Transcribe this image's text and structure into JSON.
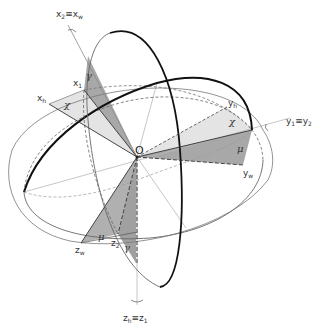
{
  "diagram": {
    "type": "3d-coordinate-frame-rotation",
    "origin_label": "O",
    "axes": {
      "x_top": "x₂≡xᵥ",
      "x_top_main": "x",
      "x_top_sub": "2",
      "x_top_equiv": "≡",
      "x_top_main2": "x",
      "x_top_sub2": "w",
      "y_right_main": "y",
      "y_right_sub": "1",
      "y_right_equiv": "≡",
      "y_right_main2": "y",
      "y_right_sub2": "2",
      "z_bottom_main": "z",
      "z_bottom_sub": "h",
      "z_bottom_equiv": "≡",
      "z_bottom_main2": "z",
      "z_bottom_sub2": "1"
    },
    "points": {
      "x1": {
        "main": "x",
        "sub": "1"
      },
      "xh": {
        "main": "x",
        "sub": "h"
      },
      "yh": {
        "main": "y",
        "sub": "h"
      },
      "yw": {
        "main": "y",
        "sub": "w"
      },
      "zw": {
        "main": "z",
        "sub": "w"
      },
      "z2": {
        "main": "z",
        "sub": "2"
      }
    },
    "angles": {
      "gamma_top": "γ",
      "chi_left": "χ",
      "chi_right": "χ",
      "mu_right": "μ",
      "mu_bottom": "μ",
      "gamma_bottom": "γ"
    },
    "colors": {
      "line": "#2a2a2a",
      "thin_line": "#6a6a6a",
      "light_axis": "#b5b5b5",
      "dark_fill": "#a9a9a9",
      "light_fill": "#e2e2e2"
    }
  }
}
